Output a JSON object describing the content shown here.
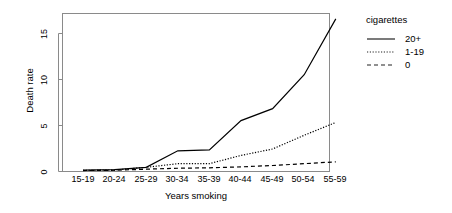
{
  "chart_data": {
    "type": "line",
    "title": "",
    "xlabel": "Years smoking",
    "ylabel": "Death rate",
    "categories": [
      "15-19",
      "20-24",
      "25-29",
      "30-34",
      "35-39",
      "40-44",
      "45-49",
      "50-54",
      "55-59"
    ],
    "ylim": [
      0,
      17.2
    ],
    "yticks": [
      0,
      5,
      10,
      15
    ],
    "ytick_labels": [
      "0",
      "5",
      "10",
      "15"
    ],
    "grid": false,
    "legend_position": "right",
    "legend_title": "cigarettes",
    "series": [
      {
        "name": "20+",
        "linestyle": "solid",
        "color": "#000000",
        "values": [
          0.1,
          0.15,
          0.4,
          2.2,
          2.3,
          5.5,
          6.8,
          10.5,
          16.6
        ]
      },
      {
        "name": "1-19",
        "linestyle": "dotted",
        "color": "#000000",
        "values": [
          0.07,
          0.1,
          0.4,
          0.8,
          0.8,
          1.7,
          2.4,
          3.9,
          5.3
        ]
      },
      {
        "name": "0",
        "linestyle": "dashed",
        "color": "#000000",
        "values": [
          0.05,
          0.08,
          0.2,
          0.3,
          0.35,
          0.45,
          0.6,
          0.8,
          1.0
        ]
      }
    ]
  },
  "axes": {
    "x_title": "Years smoking",
    "y_title": "Death rate",
    "x_tick_labels": [
      "15-19",
      "20-24",
      "25-29",
      "30-34",
      "35-39",
      "40-44",
      "45-49",
      "50-54",
      "55-59"
    ],
    "y_tick_labels": [
      "15",
      "10",
      "5",
      "0"
    ]
  },
  "legend": {
    "title": "cigarettes",
    "entries": [
      {
        "label": "20+",
        "style": "solid"
      },
      {
        "label": "1-19",
        "style": "dotted"
      },
      {
        "label": "0",
        "style": "dashed"
      }
    ]
  },
  "colors": {
    "foreground": "#000000",
    "background": "#ffffff",
    "line": "#222222"
  }
}
